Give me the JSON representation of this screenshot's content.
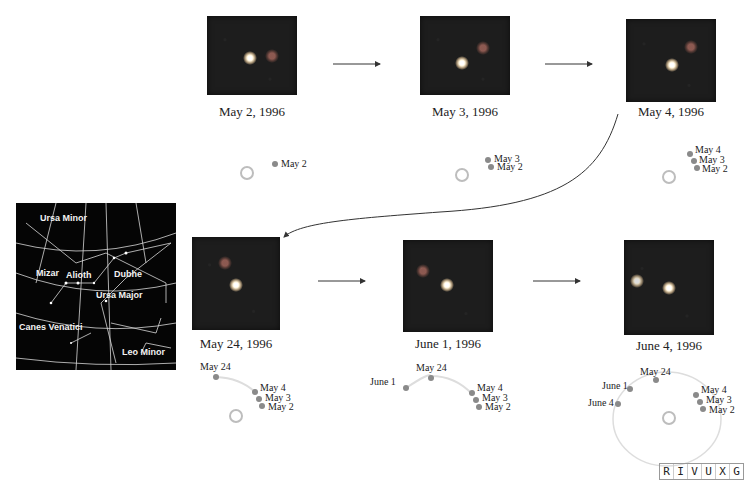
{
  "figure": {
    "skymap": {
      "labels": {
        "ursa_minor": "Ursa Minor",
        "mizar": "Mizar",
        "alioth": "Alioth",
        "dubhe": "Dubhe",
        "ursa_major": "Ursa Major",
        "canes_venatici": "Canes Venatici",
        "leo_minor": "Leo Minor"
      },
      "grid_labels": [
        "16h",
        "14h",
        "12h",
        "10h",
        "70°",
        "50°",
        "30°"
      ]
    },
    "panels": [
      {
        "date": "May 2, 1996"
      },
      {
        "date": "May 3, 1996"
      },
      {
        "date": "May 4, 1996"
      },
      {
        "date": "May 24, 1996"
      },
      {
        "date": "June 1, 1996"
      },
      {
        "date": "June 4, 1996"
      }
    ],
    "orbit_labels": {
      "may2": "May 2",
      "may3": "May 3",
      "may4": "May 4",
      "may24": "May 24",
      "june1": "June 1",
      "june4": "June 4"
    },
    "wavelength_bar": [
      "R",
      "I",
      "V",
      "U",
      "X",
      "G"
    ]
  }
}
